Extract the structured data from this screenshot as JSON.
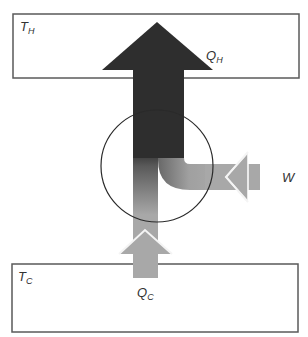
{
  "diagram": {
    "hot_reservoir": {
      "label": "T",
      "subscript": "H"
    },
    "cold_reservoir": {
      "label": "T",
      "subscript": "C"
    },
    "heat_out": {
      "label": "Q",
      "subscript": "H"
    },
    "heat_in": {
      "label": "Q",
      "subscript": "C"
    },
    "work_in": {
      "label": "W"
    },
    "colors": {
      "box_stroke": "#5a5a5a",
      "hot_arrow": "#2e2e2e",
      "cold_arrow": "#a8a8a8",
      "work_arrow": "#a8a8a8",
      "circle_stroke": "#2a2a2a"
    }
  }
}
